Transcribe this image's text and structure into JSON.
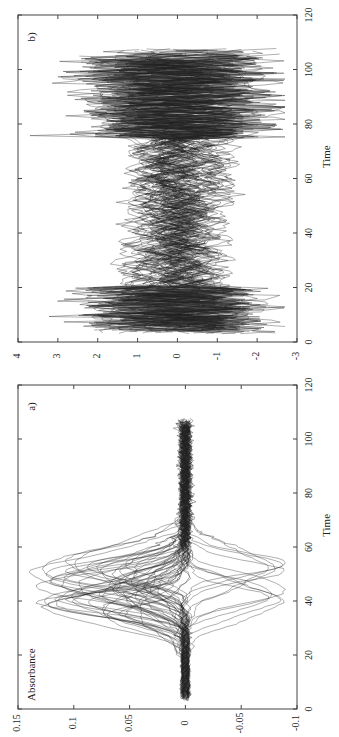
{
  "figure": {
    "rotation": "90deg counter-clockwise (x-axis runs bottom-to-top on right side)",
    "panels": [
      "a)",
      "b)"
    ]
  },
  "chart_data": [
    {
      "type": "line",
      "panel": "a)",
      "title": "",
      "xlabel": "Time",
      "ylabel": "Absorbance",
      "xlim": [
        0,
        120
      ],
      "ylim": [
        -0.1,
        0.15
      ],
      "x_ticks": [
        "0",
        "20",
        "40",
        "60",
        "80",
        "100",
        "120"
      ],
      "y_ticks": [
        "-0.1",
        "-0.05",
        "0",
        "0.05",
        "0.1",
        "0.15"
      ],
      "grid": false,
      "description": "Many overlaid absorbance curves (~60), near 0 from time 0-20, large positive peaks (up to ~0.14) around time 35-55, a bundle dipping to ~-0.09 around time 48, returning to ~0 by time 70-105.",
      "series_summary": {
        "count_approx": 60,
        "baseline": 0,
        "peak_max": 0.14,
        "peak_time_range": [
          35,
          55
        ],
        "min_value": -0.09,
        "min_time": 48,
        "end_time": 107
      }
    },
    {
      "type": "line",
      "panel": "b)",
      "title": "",
      "xlabel": "Time",
      "ylabel": "",
      "xlim": [
        0,
        120
      ],
      "ylim": [
        -3,
        4
      ],
      "x_ticks": [
        "0",
        "20",
        "40",
        "60",
        "80",
        "100",
        "120"
      ],
      "y_ticks": [
        "-3",
        "-2",
        "-1",
        "0",
        "1",
        "2",
        "3",
        "4"
      ],
      "grid": false,
      "description": "Standardized versions of the same curves; high-variance noisy oscillation between -2.5 and 3.5 at times 0-20 and 75-107, smoother crossing curves in 20-75 region.",
      "series_summary": {
        "count_approx": 60,
        "range": [
          -2.6,
          3.6
        ],
        "end_time": 107
      }
    }
  ]
}
